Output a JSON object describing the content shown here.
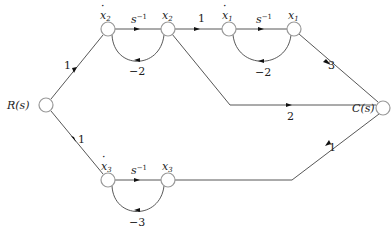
{
  "diagram": {
    "type": "signal-flow-graph",
    "nodes": [
      {
        "id": "R",
        "label": "R(s)"
      },
      {
        "id": "x2dot",
        "label": "ẋ₂"
      },
      {
        "id": "x2",
        "label": "x₂"
      },
      {
        "id": "x1dot",
        "label": "ẋ₁"
      },
      {
        "id": "x1",
        "label": "x₁"
      },
      {
        "id": "C",
        "label": "C(s)"
      },
      {
        "id": "x3dot",
        "label": "ẋ₃"
      },
      {
        "id": "x3",
        "label": "x₃"
      }
    ],
    "edges": [
      {
        "from": "R",
        "to": "x2dot",
        "gain": "1"
      },
      {
        "from": "x2dot",
        "to": "x2",
        "gain": "s⁻¹"
      },
      {
        "from": "x2",
        "to": "x2dot",
        "gain": "−2"
      },
      {
        "from": "x2",
        "to": "x1dot",
        "gain": "1"
      },
      {
        "from": "x1dot",
        "to": "x1",
        "gain": "s⁻¹"
      },
      {
        "from": "x1",
        "to": "x1dot",
        "gain": "−2"
      },
      {
        "from": "x1",
        "to": "C",
        "gain": "3"
      },
      {
        "from": "x2",
        "to": "C",
        "gain": "2"
      },
      {
        "from": "R",
        "to": "x3dot",
        "gain": "1"
      },
      {
        "from": "x3dot",
        "to": "x3",
        "gain": "s⁻¹"
      },
      {
        "from": "x3",
        "to": "x3dot",
        "gain": "−3"
      },
      {
        "from": "x3",
        "to": "C",
        "gain": "1"
      }
    ]
  },
  "labels": {
    "R": "R(s)",
    "C": "C(s)",
    "x2dot": "x",
    "x2dot_sub": "2",
    "x2": "x",
    "x2_sub": "2",
    "x1dot": "x",
    "x1dot_sub": "1",
    "x1": "x",
    "x1_sub": "1",
    "x3dot": "x",
    "x3dot_sub": "3",
    "x3": "x",
    "x3_sub": "3",
    "dot": "·",
    "s": "s",
    "neg1": "−1",
    "g_R_x2dot": "1",
    "g_x2_feedback": "−2",
    "g_x2_x1dot": "1",
    "g_x1_feedback": "−2",
    "g_x1_C": "3",
    "g_x2_C": "2",
    "g_R_x3dot": "1",
    "g_x3_feedback": "−3",
    "g_x3_C": "1"
  }
}
